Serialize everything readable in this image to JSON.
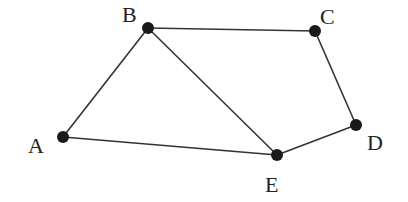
{
  "diagram": {
    "type": "graph",
    "nodes": [
      {
        "id": "A",
        "label": "A",
        "x": 63,
        "y": 137,
        "lx": 28,
        "ly": 153
      },
      {
        "id": "B",
        "label": "B",
        "x": 148,
        "y": 28,
        "lx": 122,
        "ly": 22
      },
      {
        "id": "C",
        "label": "C",
        "x": 315,
        "y": 31,
        "lx": 320,
        "ly": 24
      },
      {
        "id": "D",
        "label": "D",
        "x": 356,
        "y": 125,
        "lx": 367,
        "ly": 150
      },
      {
        "id": "E",
        "label": "E",
        "x": 277,
        "y": 155,
        "lx": 265,
        "ly": 192
      }
    ],
    "edges": [
      [
        "A",
        "B"
      ],
      [
        "B",
        "C"
      ],
      [
        "B",
        "E"
      ],
      [
        "C",
        "D"
      ],
      [
        "D",
        "E"
      ],
      [
        "A",
        "E"
      ]
    ],
    "colors": {
      "edge": "#333333",
      "node": "#1a1a1a",
      "label": "#222222"
    }
  }
}
